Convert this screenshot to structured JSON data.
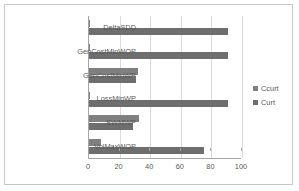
{
  "chart_data": {
    "type": "bar",
    "orientation": "horizontal",
    "title": "",
    "xlabel": "",
    "ylabel": "",
    "xlim": [
      0,
      100
    ],
    "xticks": [
      0,
      20,
      40,
      60,
      80,
      100
    ],
    "grid": true,
    "legend_position": "right",
    "categories": [
      "DeltaSDD",
      "GenCostMinWOP",
      "GenCostMinWP",
      "LossMinWP",
      "SWMWP",
      "VolMaxWOP"
    ],
    "series": [
      {
        "name": "Ccurt",
        "color": "#808080",
        "values": [
          0.5,
          0.5,
          32,
          0.5,
          33,
          8
        ]
      },
      {
        "name": "Curt",
        "color": "#6e6e6e",
        "values": [
          91,
          91,
          31,
          91,
          29,
          75
        ]
      }
    ]
  },
  "legend": {
    "items": [
      {
        "label": "Ccurt",
        "color": "#808080"
      },
      {
        "label": "Curt",
        "color": "#6e6e6e"
      }
    ]
  }
}
